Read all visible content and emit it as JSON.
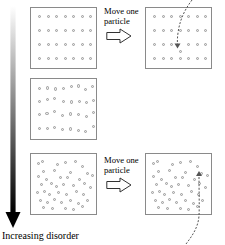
{
  "figure": {
    "title_text": "Increasing disorder",
    "axis_arrow": {
      "name": "increasing-disorder-gradient-arrow",
      "direction": "down",
      "gradient_from": "#ffffff",
      "gradient_to": "#000000",
      "x": 13,
      "top_y": 6,
      "bottom_y": 228
    }
  },
  "colors": {
    "box_border": "#8a8a8a",
    "particle_fill": "#e8e8e8",
    "particle_stroke": "#9a9a9a",
    "arrow_stroke": "#555555",
    "text": "#000000"
  },
  "captions": [
    {
      "id": "caption-top",
      "line1": "Move one",
      "line2": "particle",
      "x": 104,
      "y": 6
    },
    {
      "id": "caption-bottom",
      "line1": "Move one",
      "line2": "particle",
      "x": 104,
      "y": 155
    }
  ],
  "block_arrows": [
    {
      "id": "block-arrow-top",
      "x": 106,
      "y": 28,
      "w": 26,
      "h": 16
    },
    {
      "id": "block-arrow-bottom",
      "x": 106,
      "y": 177,
      "w": 26,
      "h": 16
    }
  ],
  "boxes": [
    {
      "id": "box-ordered-before",
      "label": "ordered-lattice-before",
      "x": 30,
      "y": 7,
      "w": 67,
      "h": 62,
      "state": "ordered",
      "particles": [
        [
          7,
          7
        ],
        [
          15.5,
          7
        ],
        [
          24,
          7
        ],
        [
          32.5,
          7
        ],
        [
          41,
          7
        ],
        [
          49.5,
          7
        ],
        [
          58,
          7
        ],
        [
          7,
          21
        ],
        [
          15.5,
          21
        ],
        [
          24,
          21
        ],
        [
          32.5,
          21
        ],
        [
          41,
          21
        ],
        [
          49.5,
          21
        ],
        [
          58,
          21
        ],
        [
          7,
          35
        ],
        [
          15.5,
          35
        ],
        [
          24,
          35
        ],
        [
          32.5,
          35
        ],
        [
          41,
          35
        ],
        [
          49.5,
          35
        ],
        [
          58,
          35
        ],
        [
          7,
          49
        ],
        [
          15.5,
          49
        ],
        [
          24,
          49
        ],
        [
          32.5,
          49
        ],
        [
          41,
          49
        ],
        [
          49.5,
          49
        ],
        [
          58,
          49
        ]
      ]
    },
    {
      "id": "box-ordered-after",
      "label": "ordered-lattice-after-one-moved",
      "x": 145,
      "y": 7,
      "w": 67,
      "h": 62,
      "state": "ordered-one-displaced",
      "particles": [
        [
          7,
          7
        ],
        [
          15.5,
          7
        ],
        [
          24,
          7
        ],
        [
          32.5,
          7
        ],
        [
          41,
          7
        ],
        [
          49.5,
          7
        ],
        [
          58,
          7
        ],
        [
          7,
          21
        ],
        [
          15.5,
          21
        ],
        [
          24,
          21
        ],
        [
          32.5,
          21
        ],
        [
          41,
          21
        ],
        [
          49.5,
          21
        ],
        [
          58,
          21
        ],
        [
          7,
          35
        ],
        [
          15.5,
          35
        ],
        [
          24,
          35
        ],
        [
          41,
          35
        ],
        [
          49.5,
          35
        ],
        [
          58,
          35
        ],
        [
          7,
          49
        ],
        [
          15.5,
          49
        ],
        [
          24,
          49
        ],
        [
          32.5,
          49
        ],
        [
          41,
          49
        ],
        [
          49.5,
          49
        ],
        [
          58,
          49
        ]
      ],
      "moved_particle": [
        32.5,
        41.5
      ]
    },
    {
      "id": "box-intermediate",
      "label": "intermediate-partially-disordered",
      "x": 30,
      "y": 78,
      "w": 67,
      "h": 62,
      "state": "partially-disordered",
      "particles": [
        [
          6.5,
          7.5
        ],
        [
          14.5,
          7.2
        ],
        [
          23,
          8.2
        ],
        [
          31,
          7.8
        ],
        [
          38.5,
          5.5
        ],
        [
          46,
          5.2
        ],
        [
          53,
          8.5
        ],
        [
          60,
          5.8
        ],
        [
          6.8,
          20.5
        ],
        [
          14.8,
          18.5
        ],
        [
          22,
          17.5
        ],
        [
          30.5,
          20.8
        ],
        [
          38.8,
          21.2
        ],
        [
          46.5,
          20.5
        ],
        [
          54,
          21.5
        ],
        [
          60.5,
          19.5
        ],
        [
          6.5,
          33.5
        ],
        [
          14.2,
          32.8
        ],
        [
          21.5,
          30.5
        ],
        [
          29.5,
          35
        ],
        [
          37.5,
          33.2
        ],
        [
          45.5,
          33.5
        ],
        [
          53.5,
          35.5
        ],
        [
          61,
          31.5
        ],
        [
          6.8,
          47.5
        ],
        [
          14.5,
          47.8
        ],
        [
          22,
          46.5
        ],
        [
          30,
          49
        ],
        [
          38,
          48.2
        ],
        [
          46,
          50
        ],
        [
          53,
          50.5
        ],
        [
          60.5,
          45.5
        ]
      ]
    },
    {
      "id": "box-disordered-before",
      "label": "disordered-gas-before",
      "x": 30,
      "y": 153,
      "w": 67,
      "h": 62,
      "state": "disordered",
      "particles": [
        [
          5.5,
          7.5
        ],
        [
          9.5,
          5.5
        ],
        [
          25,
          9
        ],
        [
          33,
          7
        ],
        [
          43,
          6
        ],
        [
          50,
          10.5
        ],
        [
          11,
          16
        ],
        [
          21.5,
          14.5
        ],
        [
          38,
          16.5
        ],
        [
          55,
          18
        ],
        [
          60,
          19.5
        ],
        [
          6,
          21
        ],
        [
          14,
          23.5
        ],
        [
          28,
          22
        ],
        [
          35,
          21.5
        ],
        [
          47,
          24
        ],
        [
          9,
          29
        ],
        [
          19,
          28
        ],
        [
          24,
          31
        ],
        [
          31,
          28.5
        ],
        [
          41,
          30
        ],
        [
          52,
          28
        ],
        [
          58,
          32
        ],
        [
          5,
          37
        ],
        [
          12,
          35.5
        ],
        [
          17,
          39
        ],
        [
          26,
          37
        ],
        [
          34,
          38.5
        ],
        [
          44,
          36
        ],
        [
          51,
          39
        ],
        [
          8,
          45
        ],
        [
          15,
          47
        ],
        [
          22,
          44
        ],
        [
          29,
          46.5
        ],
        [
          38,
          45
        ],
        [
          46,
          48
        ],
        [
          55,
          44.5
        ],
        [
          11,
          52
        ],
        [
          20,
          53
        ],
        [
          33,
          52.5
        ],
        [
          41,
          53.5
        ],
        [
          50,
          51
        ]
      ]
    },
    {
      "id": "box-disordered-after",
      "label": "disordered-gas-after-one-moved",
      "x": 145,
      "y": 153,
      "w": 67,
      "h": 62,
      "state": "disordered-one-moved",
      "particles": [
        [
          5.5,
          7.5
        ],
        [
          9.5,
          5.5
        ],
        [
          25,
          9
        ],
        [
          33,
          7
        ],
        [
          43,
          6
        ],
        [
          50,
          10.5
        ],
        [
          11,
          16
        ],
        [
          21.5,
          14.5
        ],
        [
          38,
          16.5
        ],
        [
          60,
          19.5
        ],
        [
          6,
          21
        ],
        [
          14,
          23.5
        ],
        [
          28,
          22
        ],
        [
          35,
          21.5
        ],
        [
          47,
          24
        ],
        [
          9,
          29
        ],
        [
          19,
          28
        ],
        [
          24,
          31
        ],
        [
          31,
          28.5
        ],
        [
          41,
          30
        ],
        [
          52,
          28
        ],
        [
          58,
          32
        ],
        [
          5,
          37
        ],
        [
          12,
          35.5
        ],
        [
          17,
          39
        ],
        [
          26,
          37
        ],
        [
          34,
          38.5
        ],
        [
          44,
          36
        ],
        [
          51,
          39
        ],
        [
          8,
          45
        ],
        [
          15,
          47
        ],
        [
          22,
          44
        ],
        [
          29,
          46.5
        ],
        [
          38,
          45
        ],
        [
          46,
          48
        ],
        [
          55,
          44.5
        ],
        [
          11,
          52
        ],
        [
          20,
          53
        ],
        [
          33,
          52.5
        ],
        [
          41,
          53.5
        ],
        [
          50,
          51
        ]
      ],
      "moved_particle": [
        54,
        17.5
      ]
    }
  ],
  "dashed_arrows": [
    {
      "id": "dashed-arrow-top",
      "label": "particle-trajectory-top",
      "path": "M 192 0 C 186 8, 180 18, 178 33 C 177 40, 177.5 44, 177.5 46",
      "arrowhead_x": 177.5,
      "arrowhead_y": 48.5
    },
    {
      "id": "dashed-arrow-bottom",
      "label": "particle-trajectory-bottom",
      "path": "M 186 244 C 192 236, 198 228, 199 216 C 199.5 205, 199 192, 199 175",
      "arrowhead_x": 199,
      "arrowhead_y": 171
    }
  ]
}
